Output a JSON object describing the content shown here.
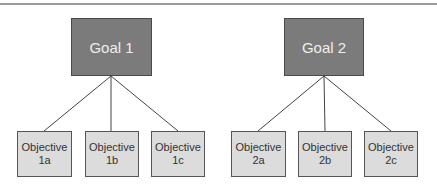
{
  "diagram": {
    "colors": {
      "goal_fill": "#7b7b7b",
      "goal_text": "#eeeeee",
      "objective_fill": "#dcdcdc",
      "objective_text": "#333333",
      "line": "#444444",
      "rule": "#9a9a9a"
    },
    "goals": [
      {
        "label": "Goal 1",
        "objectives": [
          {
            "line1": "Objective",
            "line2": "1a"
          },
          {
            "line1": "Objective",
            "line2": "1b"
          },
          {
            "line1": "Objective",
            "line2": "1c"
          }
        ]
      },
      {
        "label": "Goal 2",
        "objectives": [
          {
            "line1": "Objective",
            "line2": "2a"
          },
          {
            "line1": "Objective",
            "line2": "2b"
          },
          {
            "line1": "Objective",
            "line2": "2c"
          }
        ]
      }
    ]
  }
}
